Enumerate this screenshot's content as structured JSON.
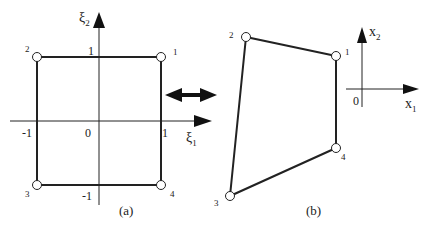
{
  "panel_a": {
    "caption": "(a)",
    "axis_x": {
      "symbol": "ξ",
      "subscript": "1"
    },
    "axis_y": {
      "symbol": "ξ",
      "subscript": "2"
    },
    "ticks": {
      "x_neg": "-1",
      "origin": "0",
      "x_pos": "1",
      "y_pos": "1",
      "y_neg": "-1"
    },
    "nodes": [
      {
        "id": "1",
        "x": 161,
        "y": 57
      },
      {
        "id": "2",
        "x": 37,
        "y": 57
      },
      {
        "id": "3",
        "x": 37,
        "y": 185
      },
      {
        "id": "4",
        "x": 161,
        "y": 185
      }
    ]
  },
  "panel_b": {
    "caption": "(b)",
    "axis_x": {
      "symbol": "x",
      "subscript": "1"
    },
    "axis_y": {
      "symbol": "x",
      "subscript": "2"
    },
    "origin": "0",
    "nodes": [
      {
        "id": "1",
        "x": 336,
        "y": 56
      },
      {
        "id": "2",
        "x": 246,
        "y": 37
      },
      {
        "id": "3",
        "x": 230,
        "y": 196
      },
      {
        "id": "4",
        "x": 336,
        "y": 148
      }
    ]
  },
  "mapping_arrow": {
    "meaning": "bidirectional mapping"
  }
}
